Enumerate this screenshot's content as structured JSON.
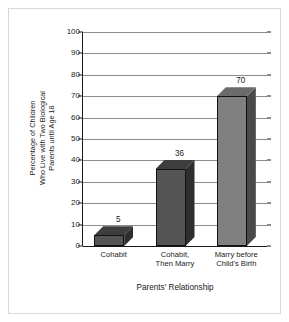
{
  "chart_data": {
    "type": "bar",
    "title": "",
    "categories": [
      "Cohabit",
      "Cohabit, Then Marry",
      "Marry before Child's Birth"
    ],
    "category_lines": [
      [
        "Cohabit"
      ],
      [
        "Cohabit,",
        "Then Marry"
      ],
      [
        "Marry before",
        "Child's Birth"
      ]
    ],
    "values": [
      5,
      36,
      70
    ],
    "value_labels": [
      "5",
      "36",
      "70"
    ],
    "xlabel": "Parents' Relationship",
    "ylabel": "Percentage of Children Who Live with Two Biological Parents until Age 18",
    "ylabel_lines": [
      "Percentage of Children",
      "Who Live with Two Biological",
      "Parents until Age 18"
    ],
    "ylim": [
      0,
      100
    ],
    "ytick_step": 10,
    "yticks": [
      0,
      10,
      20,
      30,
      40,
      50,
      60,
      70,
      80,
      90,
      100
    ],
    "ytick_labels": [
      "0",
      "10",
      "20",
      "30",
      "40",
      "50",
      "60",
      "70",
      "80",
      "90",
      "100"
    ],
    "grid": true,
    "legend": false,
    "style": "3d-bars-grayscale",
    "colors": {
      "bar_front_dark": "#555555",
      "bar_front_light": "#808080",
      "bar_top_dark": "#3d3d3d",
      "bar_top_light": "#6b6b6b",
      "bar_side_dark": "#2e2e2e",
      "bar_side_light": "#4a4a4a",
      "bar_outline": "#111111",
      "gridline": "#8c8c8c",
      "axis": "#1a1a1a",
      "frame": "#d8d8d8",
      "background": "#ffffff",
      "text": "#1a1a1a"
    },
    "bar_shades": [
      "dark",
      "dark",
      "light"
    ]
  }
}
